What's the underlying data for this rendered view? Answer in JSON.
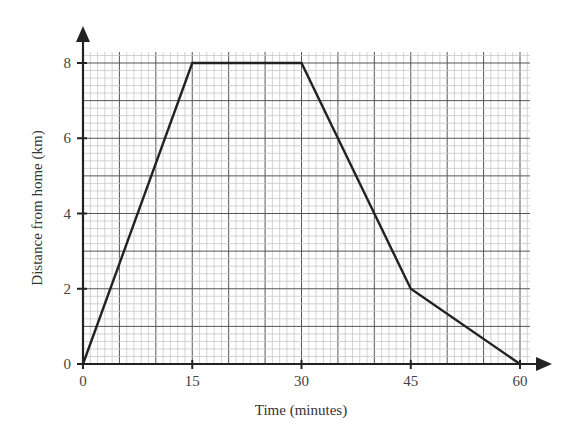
{
  "chart_data": {
    "type": "line",
    "title": "",
    "xlabel": "Time (minutes)",
    "ylabel": "Distance from home (km)",
    "xlim": [
      0,
      60
    ],
    "ylim": [
      0,
      8
    ],
    "xticks": [
      0,
      15,
      30,
      45,
      60
    ],
    "yticks": [
      0,
      2,
      4,
      6,
      8
    ],
    "xtick_labels": [
      "0",
      "15",
      "30",
      "45",
      "60"
    ],
    "ytick_labels": [
      "0",
      "2",
      "4",
      "6",
      "8"
    ],
    "grid": true,
    "grid_minor": {
      "x_step": 1,
      "y_step": 0.2
    },
    "grid_major": {
      "x_step": 5,
      "y_step": 1
    },
    "legend": null,
    "series": [
      {
        "name": "Distance from home",
        "x": [
          0,
          15,
          30,
          35,
          45,
          60
        ],
        "y": [
          0,
          8,
          8,
          6,
          2,
          0
        ],
        "color": "#222222"
      }
    ]
  },
  "colors": {
    "line": "#222222",
    "axis": "#222222",
    "grid_minor": "#c8c8c8",
    "grid_major": "#555555"
  }
}
